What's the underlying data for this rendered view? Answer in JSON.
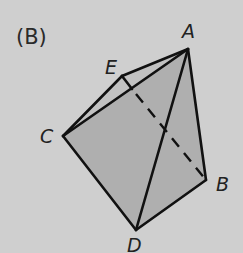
{
  "figure": {
    "panel_label": "(B)",
    "colors": {
      "background": "#cfcfcf",
      "face_fill": "#afafaf",
      "strip_fill": "#c2c2c2",
      "stroke": "#111111"
    },
    "vertices": {
      "A": {
        "label": "A",
        "x": 188,
        "y": 49
      },
      "B": {
        "label": "B",
        "x": 206,
        "y": 180
      },
      "C": {
        "label": "C",
        "x": 63,
        "y": 136
      },
      "D": {
        "label": "D",
        "x": 136,
        "y": 230
      },
      "E": {
        "label": "E",
        "x": 122,
        "y": 76
      }
    },
    "edges_solid": [
      "A-E",
      "E-C",
      "A-C",
      "A-D",
      "A-B",
      "C-D",
      "D-B",
      "E-P"
    ],
    "edges_dashed": [
      "P-B"
    ],
    "note_point_P": {
      "x": 132,
      "y": 89
    }
  }
}
